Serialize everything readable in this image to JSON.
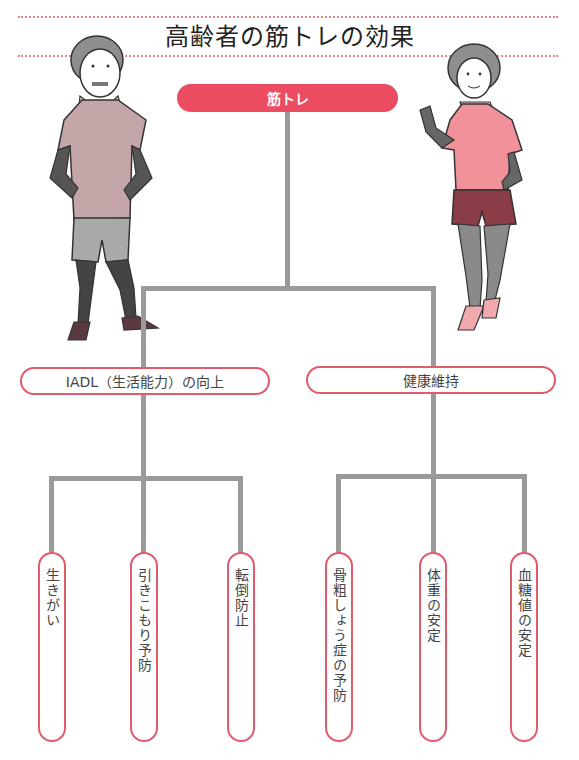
{
  "title": "高齢者の筋トレの効果",
  "root": {
    "label": "筋トレ"
  },
  "branches": [
    {
      "label": "IADL（生活能力）の向上",
      "leaves": [
        "生きがい",
        "引きこもり予防",
        "転倒防止"
      ]
    },
    {
      "label": "健康維持",
      "leaves": [
        "骨粗しょう症の予防",
        "体重の安定",
        "血糖値の安定"
      ]
    }
  ],
  "illustrations": {
    "left": "elderly-man-exercising",
    "right": "elderly-woman-exercising"
  },
  "colors": {
    "accent": "#ec4c61",
    "pill_border": "#e25a6c",
    "connector": "#9a9a9a",
    "dotted_rule": "#e8838f"
  }
}
